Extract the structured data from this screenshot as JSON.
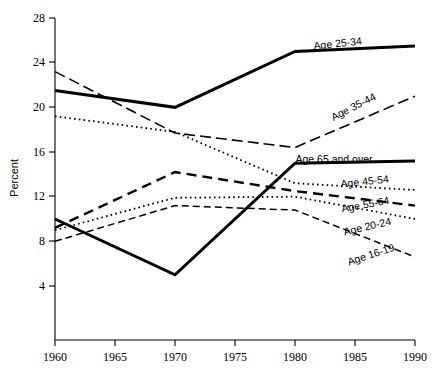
{
  "chart_data": {
    "type": "line",
    "title": "",
    "xlabel": "",
    "ylabel": "Percent",
    "x": [
      1960,
      1965,
      1970,
      1975,
      1980,
      1985,
      1990
    ],
    "xlim": [
      1960,
      1990
    ],
    "ylim": [
      0,
      28
    ],
    "yticks": [
      4,
      8,
      12,
      16,
      20,
      24,
      28
    ],
    "xticks": [
      1960,
      1965,
      1970,
      1975,
      1980,
      1985,
      1990
    ],
    "grid": false,
    "legend_position": "right-inline-labels",
    "series": [
      {
        "name": "Age 25-34",
        "label": "Age 25-34",
        "style": "solid-thick",
        "x": [
          1960,
          1970,
          1980,
          1990
        ],
        "values": [
          21.5,
          20.0,
          25.0,
          25.5
        ]
      },
      {
        "name": "Age 35-44",
        "label": "Age 35-44",
        "style": "dashed-long",
        "x": [
          1960,
          1970,
          1980,
          1990
        ],
        "values": [
          23.2,
          17.7,
          16.4,
          21.0
        ]
      },
      {
        "name": "Age 65 and over",
        "label": "Age 65 and over",
        "style": "solid-thick",
        "x": [
          1960,
          1970,
          1980,
          1990
        ],
        "values": [
          10.0,
          5.0,
          15.0,
          15.2
        ]
      },
      {
        "name": "Age 45-54",
        "label": "Age 45-54",
        "style": "dotted",
        "x": [
          1960,
          1970,
          1980,
          1990
        ],
        "values": [
          19.2,
          17.8,
          13.2,
          12.6
        ]
      },
      {
        "name": "Age 55-64",
        "label": "Age 55-64",
        "style": "dashed-long-thin",
        "x": [
          1960,
          1970,
          1980,
          1990
        ],
        "values": [
          9.2,
          14.2,
          12.5,
          11.2
        ]
      },
      {
        "name": "Age 20-24",
        "label": "Age 20-24",
        "style": "dotted",
        "x": [
          1960,
          1970,
          1980,
          1990
        ],
        "values": [
          9.0,
          11.9,
          12.0,
          10.0
        ]
      },
      {
        "name": "Age 16-19",
        "label": "Age 16-19",
        "style": "dashed-medium",
        "x": [
          1960,
          1970,
          1980,
          1990
        ],
        "values": [
          8.0,
          11.2,
          10.8,
          6.6
        ]
      }
    ],
    "series_labels": [
      {
        "text": "Age 25-34",
        "x": 338,
        "y": 47,
        "rotate": -6
      },
      {
        "text": "Age 35-44",
        "x": 355,
        "y": 110,
        "rotate": -27
      },
      {
        "text": "Age 65 and over",
        "x": 334,
        "y": 163,
        "rotate": 0
      },
      {
        "text": "Age 45-54",
        "x": 365,
        "y": 185,
        "rotate": -6
      },
      {
        "text": "Age 55-64",
        "x": 366,
        "y": 208,
        "rotate": -10
      },
      {
        "text": "Age 20-24",
        "x": 368,
        "y": 230,
        "rotate": -13
      },
      {
        "text": "Age 16-19",
        "x": 372,
        "y": 258,
        "rotate": -18
      }
    ]
  },
  "axes": {
    "y_label": "Percent",
    "y_tick_labels": [
      "28",
      "24",
      "20",
      "16",
      "12",
      "8",
      "4"
    ],
    "x_tick_labels": [
      "1960",
      "1965",
      "1970",
      "1975",
      "1980",
      "1985",
      "1990"
    ]
  },
  "colors": {
    "ink": "#000000",
    "background": "#ffffff"
  }
}
